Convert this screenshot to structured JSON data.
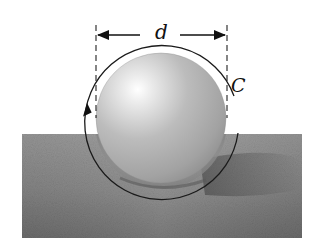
{
  "figure": {
    "labels": {
      "diameter": "d",
      "circumference": "C"
    },
    "colors": {
      "background": "#ffffff",
      "ground_light": "#b8b8b8",
      "ground_dark": "#6e6e6e",
      "sphere_highlight": "#ffffff",
      "sphere_mid": "#b4b4b4",
      "sphere_edge": "#7a7a7a",
      "stroke": "#1a1a1a"
    }
  }
}
